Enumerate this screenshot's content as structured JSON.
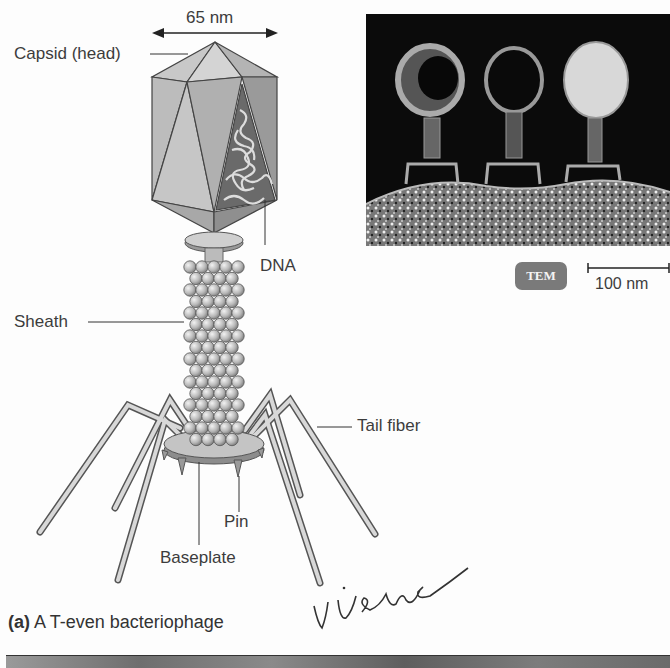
{
  "figure": {
    "diagram": {
      "title": "T-even bacteriophage structure",
      "dimension_label": "65 nm",
      "labels": {
        "capsid": "Capsid (head)",
        "dna": "DNA",
        "sheath": "Sheath",
        "tail_fiber": "Tail fiber",
        "pin": "Pin",
        "baseplate": "Baseplate"
      }
    },
    "micrograph": {
      "badge": "TEM",
      "scale_bar": "100 nm"
    },
    "caption": {
      "part": "(a)",
      "text": " A T-even bacteriophage"
    },
    "annotation": {
      "handwritten": "virus"
    }
  }
}
